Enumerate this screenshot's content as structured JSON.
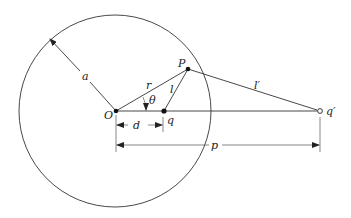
{
  "diagram": {
    "type": "image-charge geometry",
    "circle": {
      "cx": 115,
      "cy": 111,
      "r": 96
    },
    "points": {
      "O": {
        "label": "O",
        "x": 116,
        "y": 111
      },
      "P": {
        "label": "P",
        "x": 188,
        "y": 69
      },
      "q": {
        "label": "q",
        "x": 164,
        "y": 111
      },
      "q_prime": {
        "label": "q′",
        "x": 320,
        "y": 111
      }
    },
    "segments": {
      "radius": {
        "label": "a"
      },
      "OP": {
        "label": "r"
      },
      "qP": {
        "label": "l"
      },
      "Pq_prime": {
        "label": "l′"
      },
      "angle": {
        "label": "θ"
      }
    },
    "dimensions": {
      "d": {
        "label": "d"
      },
      "p": {
        "label": "p"
      }
    },
    "colors": {
      "line": "#333333",
      "background": "#ffffff"
    }
  }
}
